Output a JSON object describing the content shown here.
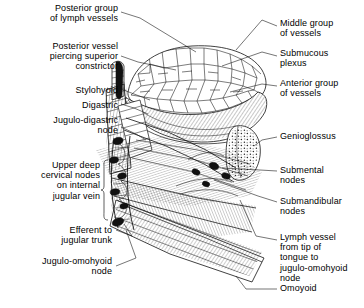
{
  "figure": {
    "background_color": "#ffffff",
    "ink_color": "#000000",
    "width": 364,
    "height": 308
  },
  "labels_left": [
    {
      "id": "posterior-group-lymph-vessels",
      "text": "Posterior group\nof lymph vessels",
      "x_right": 118,
      "y": 3
    },
    {
      "id": "posterior-vessel-piercing-superior-constrictor",
      "text": "Posterior vessel\npiercing superior\nconstrictor",
      "x_right": 118,
      "y": 41
    },
    {
      "id": "stylohyoid",
      "text": "Stylohyoid",
      "x_right": 118,
      "y": 85
    },
    {
      "id": "digastric",
      "text": "Digastric",
      "x_right": 118,
      "y": 100
    },
    {
      "id": "jugulo-digastric-node",
      "text": "Jugulo-digastric\nnode",
      "x_right": 118,
      "y": 115
    },
    {
      "id": "upper-deep-cervical-nodes",
      "text": "Upper deep\ncervical nodes\non internal\njugular vein",
      "x_right": 100,
      "y": 163
    },
    {
      "id": "efferent-to-jugular-trunk",
      "text": "Efferent to\njugular trunk",
      "x_right": 112,
      "y": 225
    },
    {
      "id": "jugulo-omohyoid-node",
      "text": "Jugulo-omohyoid\nnode",
      "x_right": 112,
      "y": 256
    }
  ],
  "labels_right": [
    {
      "id": "middle-group-of-vessels",
      "text": "Middle group\nof vessels",
      "x_left": 280,
      "y": 18
    },
    {
      "id": "submucous-plexus",
      "text": "Submucous\nplexus",
      "x_left": 280,
      "y": 48
    },
    {
      "id": "anterior-group-of-vessels",
      "text": "Anterior group\nof vessels",
      "x_left": 280,
      "y": 78
    },
    {
      "id": "genioglossus",
      "text": "Genioglossus",
      "x_left": 280,
      "y": 131
    },
    {
      "id": "submental-nodes",
      "text": "Submental\nnodes",
      "x_left": 280,
      "y": 165
    },
    {
      "id": "submandibular-nodes",
      "text": "Submandibular\nnodes",
      "x_left": 280,
      "y": 196
    },
    {
      "id": "lymph-vessel-from-tip-of-tongue",
      "text": "Lymph vessel\nfrom tip of\ntongue to\njugulo-omohyoid\nnode",
      "x_left": 280,
      "y": 232
    },
    {
      "id": "omoyoid",
      "text": "Omoyoid",
      "x_left": 280,
      "y": 283
    }
  ]
}
